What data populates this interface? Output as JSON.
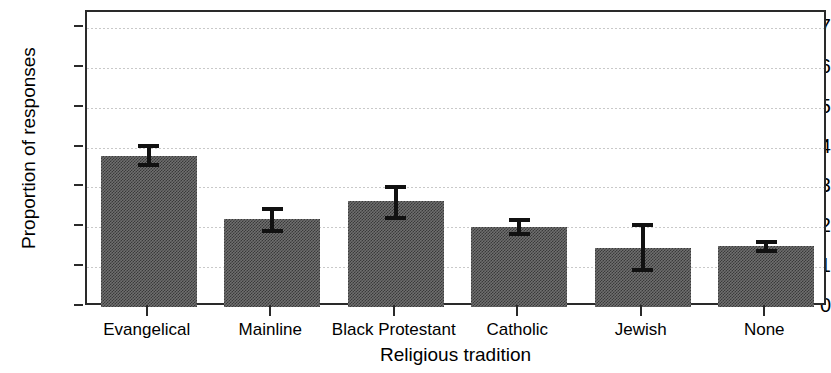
{
  "figure": {
    "ylabel": "Proportion of responses",
    "xlabel": "Religious tradition",
    "title_cropped": ""
  },
  "axis": {
    "y_ticks": [
      "0",
      ".1",
      ".2",
      ".3",
      ".4",
      ".5",
      ".6",
      ".7"
    ],
    "x_ticks": [
      "Evangelical",
      "Mainline",
      "Black Protestant",
      "Catholic",
      "Jewish",
      "None"
    ]
  },
  "colors": {
    "bar_fill": "#6f6f6f",
    "bar_pattern": "#3a3a3a",
    "axis": "#2a2a2a",
    "gridline": "#c9c9c9",
    "errorbar": "#111111",
    "background": "#ffffff"
  },
  "chart_data": {
    "type": "bar",
    "title": "",
    "xlabel": "Religious tradition",
    "ylabel": "Proportion of responses",
    "categories": [
      "Evangelical",
      "Mainline",
      "Black Protestant",
      "Catholic",
      "Jewish",
      "None"
    ],
    "values": [
      0.378,
      0.222,
      0.265,
      0.2,
      0.148,
      0.152
    ],
    "error_low": [
      0.352,
      0.185,
      0.218,
      0.178,
      0.089,
      0.135
    ],
    "error_high": [
      0.41,
      0.25,
      0.307,
      0.223,
      0.21,
      0.168
    ],
    "ylim": [
      0,
      0.74
    ],
    "ytick_values": [
      0,
      0.1,
      0.2,
      0.3,
      0.4,
      0.5,
      0.6,
      0.7
    ],
    "grid": true,
    "grid_axis": "y",
    "legend": false,
    "error_bar_type": "confidence interval"
  }
}
